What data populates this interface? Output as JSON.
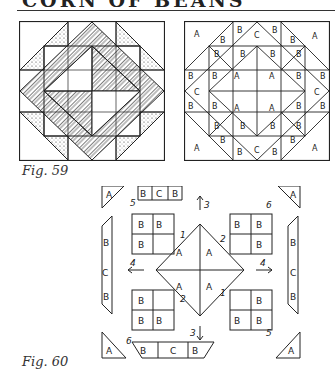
{
  "page": {
    "title": "CORN OF BEANS",
    "title_note": "title partially cut off at top edge"
  },
  "figures": [
    {
      "id": "fig59",
      "caption": "Fig. 59",
      "description": "Shaded quilt block: square-in-square with herringbone-striped and speckled triangles"
    },
    {
      "id": "fig59-labeled",
      "caption": "",
      "description": "Same quilt block with piece labels",
      "piece_labels": [
        "A",
        "B",
        "C"
      ]
    },
    {
      "id": "fig60",
      "caption": "Fig. 60",
      "description": "Exploded assembly diagram with numbered steps",
      "step_numbers": [
        "1",
        "2",
        "3",
        "4",
        "5",
        "6"
      ],
      "piece_labels": [
        "A",
        "B",
        "C"
      ]
    }
  ]
}
